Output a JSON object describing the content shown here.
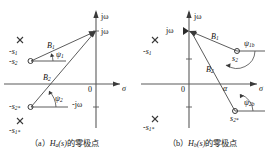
{
  "figure": {
    "kind": "pole-zero-plot-pair",
    "ink_color": "#4a4a4a",
    "text_color": "#111111"
  },
  "panel_a": {
    "id": "a",
    "axis_imag_label": "jω",
    "axis_real_label": "σ",
    "origin_label": "0",
    "point_jw_label": "jω",
    "point_minus_jw_label": "-jω",
    "vector_b1_label": "B",
    "vector_b1_sub": "1",
    "vector_b2_label": "B",
    "vector_b2_sub": "2",
    "angle_psi1_label": "ψ",
    "angle_psi1_sub": "1",
    "angle_psi2_label": "ψ",
    "angle_psi2_sub": "2",
    "pole_upper_label": "-s",
    "pole_upper_sub": "1",
    "zero_upper_label": "-s",
    "zero_upper_sub": "2",
    "zero_lower_label": "-s",
    "zero_lower_sub": "2*",
    "pole_lower_label": "-s",
    "pole_lower_sub": "1*",
    "markers": [
      {
        "name": "pole-upper",
        "symbol": "x",
        "x": 20,
        "y": 40
      },
      {
        "name": "zero-upper",
        "symbol": "o",
        "x": 30,
        "y": 61
      },
      {
        "name": "zero-lower",
        "symbol": "o",
        "x": 30,
        "y": 107
      },
      {
        "name": "pole-lower",
        "symbol": "x",
        "x": 20,
        "y": 121
      }
    ]
  },
  "panel_b": {
    "id": "b",
    "axis_imag_label": "jω",
    "axis_real_label": "σ",
    "origin_label": "0",
    "alpha_label": "α",
    "point_jw_label": "jω",
    "vector_b1_label": "B",
    "vector_b1_sub": "1",
    "vector_b2_label": "B",
    "vector_b2_sub": "2",
    "angle_psi1b_label": "ψ",
    "angle_psi1b_sub": "1b",
    "angle_psi2b_label": "ψ",
    "angle_psi2b_sub": "2b",
    "pole_upper_label": "-s",
    "pole_upper_sub": "1",
    "zero_upper_label": "s",
    "zero_upper_sub": "2",
    "zero_lower_label": "s",
    "zero_lower_sub": "2*",
    "pole_lower_label": "-s",
    "pole_lower_sub": "1*",
    "markers": [
      {
        "name": "pole-upper",
        "symbol": "x",
        "x": 18,
        "y": 40
      },
      {
        "name": "zero-upper",
        "symbol": "o",
        "x": 100,
        "y": 51
      },
      {
        "name": "zero-lower",
        "symbol": "o",
        "x": 98,
        "y": 111
      },
      {
        "name": "pole-lower",
        "symbol": "x",
        "x": 18,
        "y": 119
      }
    ]
  },
  "captions": {
    "a_prefix": "（a）",
    "a_italic": "H",
    "a_sub": "a",
    "a_paren": "(s)",
    "a_text": "的零极点",
    "b_prefix": "（b）",
    "b_italic": "H",
    "b_sub": "b",
    "b_paren": "(s)",
    "b_text": "的零极点"
  }
}
